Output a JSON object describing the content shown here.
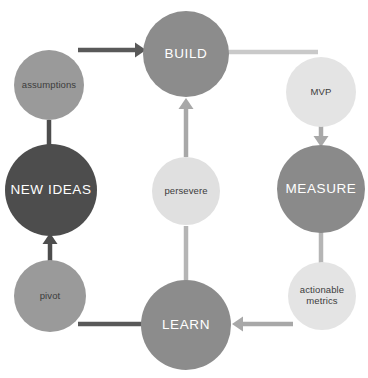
{
  "diagram": {
    "background_color": "#ffffff",
    "canvas": {
      "width": 368,
      "height": 378
    }
  },
  "nodes": [
    {
      "id": "build",
      "label": "BUILD",
      "kind": "stage",
      "cx": 186,
      "cy": 54,
      "r": 43,
      "fill": "#8c8c8c",
      "text_color": "#ffffff"
    },
    {
      "id": "measure",
      "label": "MEASURE",
      "kind": "stage",
      "cx": 321,
      "cy": 189,
      "r": 44,
      "fill": "#8a8a8a",
      "text_color": "#ffffff"
    },
    {
      "id": "learn",
      "label": "LEARN",
      "kind": "stage",
      "cx": 186,
      "cy": 325,
      "r": 45,
      "fill": "#8c8c8c",
      "text_color": "#ffffff"
    },
    {
      "id": "new-ideas",
      "label": "NEW IDEAS",
      "kind": "stage",
      "cx": 51,
      "cy": 190,
      "r": 46,
      "fill": "#4d4d4d",
      "text_color": "#ffffff"
    },
    {
      "id": "assumptions",
      "label": "assumptions",
      "kind": "sub",
      "cx": 49,
      "cy": 85,
      "r": 35,
      "fill": "#9a9a9a",
      "text_color": "#3c3c3c"
    },
    {
      "id": "pivot",
      "label": "pivot",
      "kind": "sub",
      "cx": 50,
      "cy": 296,
      "r": 36,
      "fill": "#9a9a9a",
      "text_color": "#3c3c3c"
    },
    {
      "id": "persevere",
      "label": "persevere",
      "kind": "sub",
      "cx": 186,
      "cy": 191,
      "r": 34,
      "fill": "#e0e0e0",
      "text_color": "#3c3c3c"
    },
    {
      "id": "mvp",
      "label": "MVP",
      "kind": "sub",
      "cx": 321,
      "cy": 92,
      "r": 35,
      "fill": "#e4e4e4",
      "text_color": "#3c3c3c"
    },
    {
      "id": "actionable-metrics",
      "label": "actionable\nmetrics",
      "kind": "sub",
      "cx": 322,
      "cy": 296,
      "r": 34,
      "fill": "#e4e4e4",
      "text_color": "#3c3c3c"
    }
  ],
  "connectors": [
    {
      "id": "assumptions-to-build",
      "from": "assumptions",
      "to": "build",
      "style": "arrow",
      "direction": "right",
      "color": "#595959",
      "x1": 78,
      "y1": 50,
      "x2": 146,
      "y2": 50
    },
    {
      "id": "build-to-mvp",
      "from": "build",
      "to": "mvp",
      "style": "line",
      "direction": "right",
      "color": "#c9c9c9",
      "x1": 228,
      "y1": 52,
      "x2": 318,
      "y2": 52
    },
    {
      "id": "mvp-to-measure",
      "from": "mvp",
      "to": "measure",
      "style": "arrow",
      "direction": "down",
      "color": "#a8a8a8",
      "x1": 321,
      "y1": 122,
      "x2": 321,
      "y2": 147
    },
    {
      "id": "measure-to-actionable-metrics",
      "from": "measure",
      "to": "actionable-metrics",
      "style": "line",
      "direction": "down",
      "color": "#b5b5b5",
      "x1": 321,
      "y1": 232,
      "x2": 321,
      "y2": 263
    },
    {
      "id": "actionable-metrics-to-learn",
      "from": "actionable-metrics",
      "to": "learn",
      "style": "arrow",
      "direction": "left",
      "color": "#a8a8a8",
      "x1": 293,
      "y1": 324,
      "x2": 232,
      "y2": 324
    },
    {
      "id": "learn-to-pivot",
      "from": "learn",
      "to": "pivot",
      "style": "line",
      "direction": "left",
      "color": "#595959",
      "x1": 146,
      "y1": 324,
      "x2": 78,
      "y2": 324
    },
    {
      "id": "pivot-to-new-ideas",
      "from": "pivot",
      "to": "new-ideas",
      "style": "arrow",
      "direction": "up",
      "color": "#4d4d4d",
      "x1": 50,
      "y1": 261,
      "x2": 50,
      "y2": 233
    },
    {
      "id": "assumptions-to-new-ideas",
      "from": "assumptions",
      "to": "new-ideas",
      "style": "line",
      "direction": "down",
      "color": "#4d4d4d",
      "x1": 49,
      "y1": 120,
      "x2": 49,
      "y2": 147
    },
    {
      "id": "learn-to-persevere",
      "from": "learn",
      "to": "persevere",
      "style": "line",
      "direction": "up",
      "color": "#b5b5b5",
      "x1": 186,
      "y1": 281,
      "x2": 186,
      "y2": 226
    },
    {
      "id": "persevere-to-build",
      "from": "persevere",
      "to": "build",
      "style": "arrow",
      "direction": "up",
      "color": "#a8a8a8",
      "x1": 186,
      "y1": 157,
      "x2": 186,
      "y2": 98
    }
  ]
}
